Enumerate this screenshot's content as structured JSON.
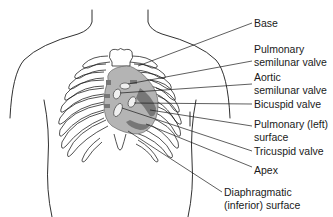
{
  "diagram": {
    "colors": {
      "outline": "#1a1a1a",
      "heart_fill": "#b4b4b4",
      "heart_dark": "#777777",
      "valve_fill": "#f0f0f0",
      "background": "#ffffff"
    },
    "labels": [
      {
        "id": "base",
        "line1": "Base",
        "line2": ""
      },
      {
        "id": "pulmonary-semilunar-valve",
        "line1": "Pulmonary",
        "line2": "semilunar valve"
      },
      {
        "id": "aortic-semilunar-valve",
        "line1": "Aortic",
        "line2": "semilunar valve"
      },
      {
        "id": "bicuspid-valve",
        "line1": "Bicuspid valve",
        "line2": ""
      },
      {
        "id": "pulmonary-left-surface",
        "line1": "Pulmonary (left)",
        "line2": "surface"
      },
      {
        "id": "tricuspid-valve",
        "line1": "Tricuspid valve",
        "line2": ""
      },
      {
        "id": "apex",
        "line1": "Apex",
        "line2": ""
      },
      {
        "id": "diaphragmatic-surface",
        "line1": "Diaphragmatic",
        "line2": "(inferior) surface"
      }
    ]
  }
}
